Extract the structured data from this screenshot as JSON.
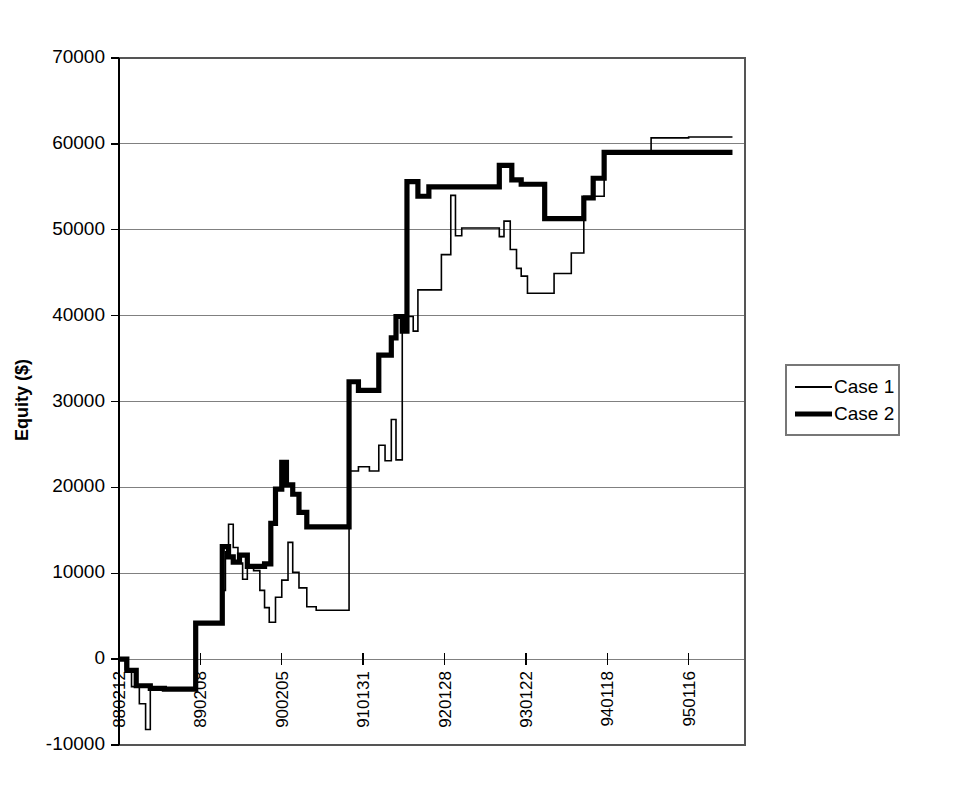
{
  "chart_data": {
    "type": "line",
    "title": "",
    "xlabel": "",
    "ylabel": "Equity ($)",
    "ylim": [
      -10000,
      70000
    ],
    "ytick_labels": [
      "70000",
      "60000",
      "50000",
      "40000",
      "30000",
      "20000",
      "10000",
      "0",
      "-10000"
    ],
    "ytick_values": [
      70000,
      60000,
      50000,
      40000,
      30000,
      20000,
      10000,
      0,
      -10000
    ],
    "xtick_labels": [
      "880212",
      "890208",
      "900205",
      "910131",
      "920128",
      "930122",
      "940118",
      "950116"
    ],
    "xtick_positions": [
      0,
      52,
      104,
      156,
      208,
      260,
      312,
      364
    ],
    "xlim": [
      0,
      400
    ],
    "grid": true,
    "legend_position": "right",
    "legend": [
      "Case 1",
      "Case 2"
    ],
    "series": [
      {
        "name": "Case 1",
        "style": "thin",
        "linewidth": 1.6,
        "color": "#000000",
        "points": [
          [
            0,
            0
          ],
          [
            4,
            0
          ],
          [
            4,
            -1200
          ],
          [
            8,
            -1200
          ],
          [
            8,
            -3200
          ],
          [
            13,
            -3200
          ],
          [
            13,
            -5200
          ],
          [
            17,
            -5200
          ],
          [
            17,
            -8200
          ],
          [
            20,
            -8200
          ],
          [
            20,
            -3300
          ],
          [
            29,
            -3300
          ],
          [
            29,
            -3400
          ],
          [
            49,
            -3400
          ],
          [
            49,
            4200
          ],
          [
            66,
            4200
          ],
          [
            66,
            8000
          ],
          [
            68,
            8000
          ],
          [
            68,
            12500
          ],
          [
            70,
            12500
          ],
          [
            70,
            15700
          ],
          [
            73,
            15700
          ],
          [
            73,
            13000
          ],
          [
            76,
            13000
          ],
          [
            76,
            11200
          ],
          [
            79,
            11200
          ],
          [
            79,
            9300
          ],
          [
            82,
            9300
          ],
          [
            82,
            10900
          ],
          [
            86,
            10900
          ],
          [
            86,
            10300
          ],
          [
            90,
            10300
          ],
          [
            90,
            8000
          ],
          [
            93,
            8000
          ],
          [
            93,
            6000
          ],
          [
            96,
            6000
          ],
          [
            96,
            4300
          ],
          [
            100,
            4300
          ],
          [
            100,
            7200
          ],
          [
            104,
            7200
          ],
          [
            104,
            9200
          ],
          [
            108,
            9200
          ],
          [
            108,
            13600
          ],
          [
            111,
            13600
          ],
          [
            111,
            10100
          ],
          [
            115,
            10100
          ],
          [
            115,
            8300
          ],
          [
            120,
            8300
          ],
          [
            120,
            6100
          ],
          [
            126,
            6100
          ],
          [
            126,
            5700
          ],
          [
            147,
            5700
          ],
          [
            147,
            21900
          ],
          [
            153,
            21900
          ],
          [
            153,
            22400
          ],
          [
            160,
            22400
          ],
          [
            160,
            21900
          ],
          [
            166,
            21900
          ],
          [
            166,
            24900
          ],
          [
            170,
            24900
          ],
          [
            170,
            23100
          ],
          [
            174,
            23100
          ],
          [
            174,
            27900
          ],
          [
            177,
            27900
          ],
          [
            177,
            23200
          ],
          [
            181,
            23200
          ],
          [
            181,
            38300
          ],
          [
            184,
            38300
          ],
          [
            184,
            39900
          ],
          [
            188,
            39900
          ],
          [
            188,
            38200
          ],
          [
            191,
            38200
          ],
          [
            191,
            43000
          ],
          [
            206,
            43000
          ],
          [
            206,
            47100
          ],
          [
            212,
            47100
          ],
          [
            212,
            54000
          ],
          [
            215,
            54000
          ],
          [
            215,
            49300
          ],
          [
            219,
            49300
          ],
          [
            219,
            50200
          ],
          [
            243,
            50200
          ],
          [
            243,
            49200
          ],
          [
            246,
            49200
          ],
          [
            246,
            51000
          ],
          [
            250,
            51000
          ],
          [
            250,
            47700
          ],
          [
            254,
            47700
          ],
          [
            254,
            45500
          ],
          [
            257,
            45500
          ],
          [
            257,
            44600
          ],
          [
            261,
            44600
          ],
          [
            261,
            42600
          ],
          [
            278,
            42600
          ],
          [
            278,
            44900
          ],
          [
            289,
            44900
          ],
          [
            289,
            47300
          ],
          [
            297,
            47300
          ],
          [
            297,
            53900
          ],
          [
            310,
            53900
          ],
          [
            310,
            59100
          ],
          [
            340,
            59100
          ],
          [
            340,
            60700
          ],
          [
            364,
            60700
          ],
          [
            364,
            60800
          ],
          [
            392,
            60800
          ]
        ]
      },
      {
        "name": "Case 2",
        "style": "thick",
        "linewidth": 5.2,
        "color": "#000000",
        "points": [
          [
            0,
            0
          ],
          [
            5,
            0
          ],
          [
            5,
            -1300
          ],
          [
            11,
            -1300
          ],
          [
            11,
            -3100
          ],
          [
            20,
            -3100
          ],
          [
            20,
            -3400
          ],
          [
            29,
            -3400
          ],
          [
            29,
            -3500
          ],
          [
            49,
            -3500
          ],
          [
            49,
            4200
          ],
          [
            66,
            4200
          ],
          [
            66,
            13100
          ],
          [
            70,
            13100
          ],
          [
            70,
            11900
          ],
          [
            73,
            11900
          ],
          [
            73,
            11300
          ],
          [
            77,
            11300
          ],
          [
            77,
            12100
          ],
          [
            82,
            12100
          ],
          [
            82,
            10800
          ],
          [
            93,
            10800
          ],
          [
            93,
            11100
          ],
          [
            97,
            11100
          ],
          [
            97,
            15800
          ],
          [
            100,
            15800
          ],
          [
            100,
            19800
          ],
          [
            104,
            19800
          ],
          [
            104,
            22900
          ],
          [
            107,
            22900
          ],
          [
            107,
            20300
          ],
          [
            111,
            20300
          ],
          [
            111,
            19200
          ],
          [
            115,
            19200
          ],
          [
            115,
            17100
          ],
          [
            120,
            17100
          ],
          [
            120,
            15400
          ],
          [
            147,
            15400
          ],
          [
            147,
            32300
          ],
          [
            153,
            32300
          ],
          [
            153,
            31300
          ],
          [
            166,
            31300
          ],
          [
            166,
            35400
          ],
          [
            174,
            35400
          ],
          [
            174,
            37400
          ],
          [
            177,
            37400
          ],
          [
            177,
            39900
          ],
          [
            181,
            39900
          ],
          [
            181,
            38200
          ],
          [
            184,
            38200
          ],
          [
            184,
            55600
          ],
          [
            191,
            55600
          ],
          [
            191,
            53900
          ],
          [
            198,
            53900
          ],
          [
            198,
            55000
          ],
          [
            243,
            55000
          ],
          [
            243,
            57500
          ],
          [
            251,
            57500
          ],
          [
            251,
            55800
          ],
          [
            257,
            55800
          ],
          [
            257,
            55300
          ],
          [
            272,
            55300
          ],
          [
            272,
            51300
          ],
          [
            297,
            51300
          ],
          [
            297,
            53700
          ],
          [
            303,
            53700
          ],
          [
            303,
            56000
          ],
          [
            310,
            56000
          ],
          [
            310,
            59000
          ],
          [
            364,
            59000
          ],
          [
            364,
            59000
          ],
          [
            392,
            59000
          ]
        ]
      }
    ]
  },
  "legend": {
    "items": [
      {
        "label": "Case 1",
        "style": "thin"
      },
      {
        "label": "Case 2",
        "style": "thick"
      }
    ]
  },
  "axes": {
    "y_title": "Equity ($)"
  }
}
